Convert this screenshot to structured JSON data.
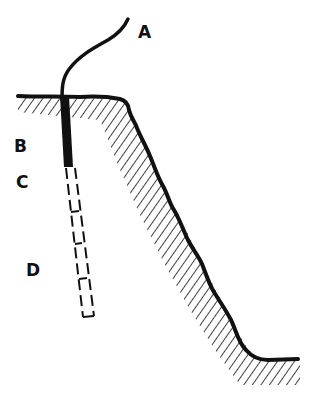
{
  "diagram": {
    "type": "geological-cross-section",
    "labels": {
      "a": "A",
      "b": "B",
      "c": "C",
      "d": "D"
    },
    "colors": {
      "ink": "#111111",
      "background": "#ffffff"
    }
  }
}
